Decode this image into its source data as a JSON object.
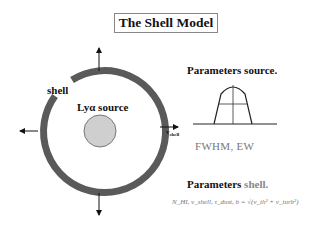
{
  "title": "The Shell Model",
  "diagram": {
    "shell_label": "shell",
    "source_label": "Lyα source",
    "velocity_label": "v",
    "velocity_subscript": "shell",
    "colors": {
      "shell_ring": "#5a5a5a",
      "source_fill": "#cfcfcf",
      "arrows": "#111111"
    }
  },
  "parameters_source": {
    "heading": "Parameters source.",
    "profile_caption": "FWHM, EW"
  },
  "parameters_shell": {
    "heading_bold": "Parameters ",
    "heading_grey": "shell.",
    "formula": "N_HI, v_shell, τ_dust, b = √(v_th² + v_turb²)"
  }
}
